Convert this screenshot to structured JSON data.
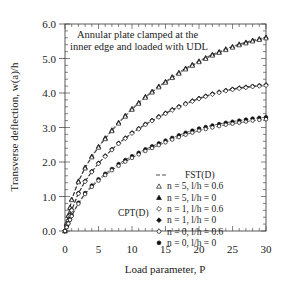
{
  "chart_data": {
    "type": "line",
    "title": "",
    "annotation": [
      "Annular plate clamped at the",
      "inner edge and loaded with UDL"
    ],
    "xlabel": "Load parameter, P",
    "ylabel": "Transverse deflection, w(a)/h",
    "xlim": [
      0,
      30
    ],
    "ylim": [
      0,
      6
    ],
    "xticks": [
      0,
      5,
      10,
      15,
      20,
      25,
      30
    ],
    "yticks": [
      0.0,
      1.0,
      2.0,
      3.0,
      4.0,
      5.0,
      6.0
    ],
    "ytick_labels": [
      "0.0",
      "1.0",
      "2.0",
      "3.0",
      "4.0",
      "5.0",
      "6.0"
    ],
    "grid": false,
    "legend_position": "lower right",
    "legend_title_left": "CPT(D)",
    "legend": [
      {
        "label": "FST(D)",
        "marker": "dash"
      },
      {
        "label": "n = 5, l/h = 0.6",
        "marker": "open-triangle"
      },
      {
        "label": "n = 5, l/h = 0",
        "marker": "filled-triangle"
      },
      {
        "label": "n = 1, l/h = 0.6",
        "marker": "open-diamond"
      },
      {
        "label": "n = 1, l/h = 0",
        "marker": "filled-diamond"
      },
      {
        "label": "n = 0, l/h = 0.6",
        "marker": "open-circle"
      },
      {
        "label": "n = 0, l/h = 0",
        "marker": "filled-circle"
      }
    ],
    "x": [
      0,
      1,
      2,
      3,
      4,
      5,
      6,
      7,
      8,
      9,
      10,
      12,
      14,
      16,
      18,
      20,
      22,
      24,
      26,
      28,
      30
    ],
    "series": [
      {
        "name": "n = 5, l/h = 0",
        "marker": "filled-triangle",
        "values": [
          0,
          0.92,
          1.45,
          1.85,
          2.17,
          2.45,
          2.7,
          2.93,
          3.15,
          3.35,
          3.55,
          3.9,
          4.2,
          4.47,
          4.72,
          4.93,
          5.12,
          5.28,
          5.42,
          5.53,
          5.62
        ]
      },
      {
        "name": "n = 5, l/h = 0.6",
        "marker": "open-triangle",
        "values": [
          0,
          0.9,
          1.42,
          1.82,
          2.14,
          2.42,
          2.67,
          2.9,
          3.12,
          3.32,
          3.52,
          3.87,
          4.17,
          4.44,
          4.69,
          4.9,
          5.09,
          5.25,
          5.39,
          5.5,
          5.59
        ]
      },
      {
        "name": "n = 1, l/h = 0",
        "marker": "filled-diamond",
        "values": [
          0,
          0.62,
          1.1,
          1.45,
          1.73,
          1.97,
          2.18,
          2.37,
          2.55,
          2.7,
          2.85,
          3.1,
          3.32,
          3.52,
          3.7,
          3.85,
          3.98,
          4.08,
          4.15,
          4.2,
          4.24
        ]
      },
      {
        "name": "n = 1, l/h = 0.6",
        "marker": "open-diamond",
        "values": [
          0,
          0.6,
          1.08,
          1.43,
          1.71,
          1.95,
          2.16,
          2.35,
          2.53,
          2.68,
          2.83,
          3.08,
          3.3,
          3.5,
          3.68,
          3.83,
          3.96,
          4.06,
          4.13,
          4.18,
          4.22
        ]
      },
      {
        "name": "n = 0, l/h = 0",
        "marker": "filled-circle",
        "values": [
          0,
          0.45,
          0.82,
          1.1,
          1.32,
          1.5,
          1.66,
          1.8,
          1.94,
          2.06,
          2.17,
          2.37,
          2.54,
          2.7,
          2.85,
          2.97,
          3.06,
          3.14,
          3.2,
          3.26,
          3.3
        ]
      },
      {
        "name": "n = 0, l/h = 0.6",
        "marker": "open-circle",
        "values": [
          0,
          0.43,
          0.79,
          1.07,
          1.28,
          1.46,
          1.62,
          1.76,
          1.89,
          2.01,
          2.12,
          2.32,
          2.49,
          2.65,
          2.79,
          2.91,
          3.0,
          3.08,
          3.14,
          3.2,
          3.24
        ]
      }
    ]
  }
}
